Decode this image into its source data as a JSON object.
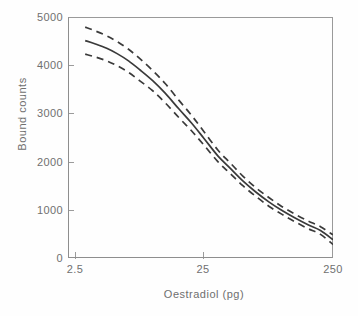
{
  "figure": {
    "background": "#ffffff",
    "line_color": "#3a3a3a",
    "axis_color": "#8e8e8e",
    "text_color": "#6f6f6f"
  },
  "axes": {
    "y": {
      "label": "Bound counts",
      "ticks": [
        "0",
        "1000",
        "2000",
        "3000",
        "4000",
        "5000"
      ],
      "values": [
        0,
        1000,
        2000,
        3000,
        4000,
        5000
      ],
      "min": 0,
      "max": 5000
    },
    "x": {
      "label": "Oestradiol (pg)",
      "ticks": [
        "2.5",
        "25",
        "250"
      ],
      "values": [
        2.5,
        25,
        250
      ],
      "min": 2.5,
      "max": 250,
      "scale": "log"
    }
  },
  "chart_data": {
    "type": "line",
    "title": "",
    "subtitle": "",
    "xlabel": "Oestradiol (pg)",
    "ylabel": "Bound counts",
    "xlim": [
      2.5,
      250
    ],
    "ylim": [
      0,
      5000
    ],
    "xscale": "log",
    "yscale": "linear",
    "grid": false,
    "legend": null,
    "legend_position": "none",
    "xticks": [
      2.5,
      25,
      250
    ],
    "xticklabels": [
      "2.5",
      "25",
      "250"
    ],
    "yticks": [
      0,
      1000,
      2000,
      3000,
      4000,
      5000
    ],
    "yticklabels": [
      "0",
      "1000",
      "2000",
      "3000",
      "4000",
      "5000"
    ],
    "x": [
      3.0,
      3.6,
      4.4,
      5.3,
      6.5,
      8.0,
      10.0,
      12.5,
      16.0,
      20.0,
      25.0,
      32.0,
      40.0,
      50.0,
      63.0,
      80.0,
      100.0,
      125.0,
      160.0,
      200.0,
      250.0
    ],
    "series": [
      {
        "name": "Fitted standard curve",
        "style": "solid",
        "values": [
          4510,
          4440,
          4350,
          4240,
          4090,
          3900,
          3680,
          3420,
          3090,
          2800,
          2480,
          2120,
          1860,
          1600,
          1370,
          1160,
          990,
          840,
          690,
          570,
          380
        ]
      },
      {
        "name": "Upper confidence limit",
        "style": "dashed",
        "values": [
          4790,
          4710,
          4610,
          4490,
          4330,
          4130,
          3890,
          3620,
          3270,
          2960,
          2620,
          2240,
          1970,
          1700,
          1460,
          1250,
          1070,
          920,
          770,
          650,
          480
        ]
      },
      {
        "name": "Lower confidence limit",
        "style": "dashed",
        "values": [
          4230,
          4170,
          4090,
          3990,
          3850,
          3670,
          3470,
          3220,
          2910,
          2640,
          2340,
          2000,
          1750,
          1500,
          1280,
          1070,
          910,
          760,
          610,
          490,
          280
        ]
      }
    ]
  }
}
